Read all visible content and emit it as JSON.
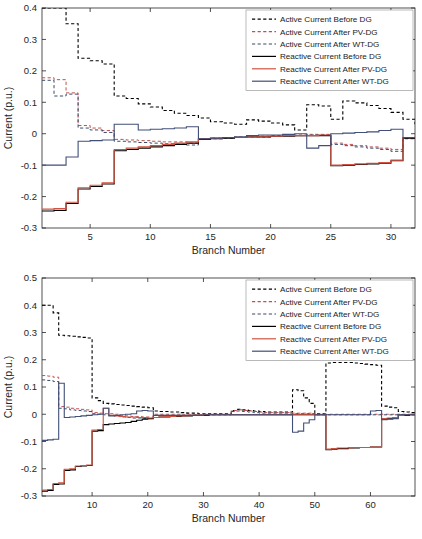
{
  "figure": {
    "title": "",
    "panels": [
      "top",
      "bottom"
    ]
  },
  "legend_entries": [
    {
      "label": "Active Current Before DG",
      "color": "#000000",
      "style": "dashed"
    },
    {
      "label": "Active Current After PV-DG",
      "color": "#c0504d",
      "style": "dashed"
    },
    {
      "label": "Active Current After WT-DG",
      "color": "#3b4a6b",
      "style": "dashed"
    },
    {
      "label": "Reactive Current Before DG",
      "color": "#000000",
      "style": "solid"
    },
    {
      "label": "Reactive Current After PV-DG",
      "color": "#cf5340",
      "style": "solid"
    },
    {
      "label": "Reactive Current After WT-DG",
      "color": "#414f77",
      "style": "solid"
    }
  ],
  "chart_data": [
    {
      "type": "line",
      "panel": "top",
      "title": "",
      "xlabel": "Branch Number",
      "ylabel": "Current (p.u.)",
      "xlim": [
        1,
        32
      ],
      "ylim": [
        -0.3,
        0.4
      ],
      "xticks": [
        5,
        10,
        15,
        20,
        25,
        30
      ],
      "yticks": [
        -0.3,
        -0.2,
        -0.1,
        0,
        0.1,
        0.2,
        0.3,
        0.4
      ],
      "grid": false,
      "legend_position": "top-right",
      "drawstyle": "steps-post",
      "x": [
        1,
        2,
        3,
        4,
        5,
        6,
        7,
        8,
        9,
        10,
        11,
        12,
        13,
        14,
        15,
        16,
        17,
        18,
        19,
        20,
        21,
        22,
        23,
        24,
        25,
        26,
        27,
        28,
        29,
        30,
        31,
        32
      ],
      "series": [
        {
          "name": "Active Current Before DG",
          "color": "#000000",
          "style": "dashed",
          "width": 1.1,
          "values": [
            0.4,
            0.4,
            0.35,
            0.24,
            0.232,
            0.222,
            0.12,
            0.112,
            0.095,
            0.085,
            0.074,
            0.065,
            0.058,
            0.05,
            0.038,
            0.034,
            0.03,
            0.044,
            0.04,
            0.034,
            0.028,
            0.012,
            0.092,
            0.088,
            0.046,
            0.104,
            0.098,
            0.09,
            0.08,
            0.068,
            0.046,
            0.03
          ]
        },
        {
          "name": "Active Current After PV-DG",
          "color": "#c0504d",
          "style": "dashed",
          "width": 1.0,
          "values": [
            0.178,
            0.172,
            0.13,
            0.026,
            0.018,
            0.01,
            -0.018,
            -0.02,
            -0.022,
            -0.024,
            -0.026,
            -0.026,
            -0.03,
            -0.016,
            -0.014,
            -0.012,
            -0.01,
            -0.008,
            -0.008,
            -0.006,
            -0.004,
            -0.004,
            -0.002,
            -0.002,
            -0.03,
            -0.034,
            -0.038,
            -0.042,
            -0.046,
            -0.05,
            -0.014,
            -0.012
          ]
        },
        {
          "name": "Active Current After WT-DG",
          "color": "#3b4a6b",
          "style": "dashed",
          "width": 1.0,
          "values": [
            0.17,
            0.12,
            0.126,
            0.018,
            0.012,
            0.004,
            -0.024,
            -0.026,
            -0.028,
            -0.03,
            -0.032,
            -0.032,
            -0.036,
            -0.018,
            -0.016,
            -0.014,
            -0.012,
            -0.01,
            -0.01,
            -0.008,
            -0.006,
            -0.006,
            -0.004,
            -0.004,
            -0.034,
            -0.038,
            -0.042,
            -0.046,
            -0.05,
            -0.056,
            -0.016,
            -0.014
          ]
        },
        {
          "name": "Reactive Current Before DG",
          "color": "#000000",
          "style": "solid",
          "width": 1.1,
          "values": [
            -0.246,
            -0.244,
            -0.222,
            -0.176,
            -0.168,
            -0.16,
            -0.054,
            -0.05,
            -0.046,
            -0.042,
            -0.038,
            -0.034,
            -0.03,
            -0.018,
            -0.016,
            -0.014,
            -0.012,
            -0.01,
            -0.01,
            -0.008,
            -0.008,
            -0.006,
            -0.006,
            -0.006,
            -0.102,
            -0.1,
            -0.098,
            -0.096,
            -0.094,
            -0.086,
            -0.014,
            -0.012
          ]
        },
        {
          "name": "Reactive Current After PV-DG",
          "color": "#cf5340",
          "style": "solid",
          "width": 1.1,
          "values": [
            -0.24,
            -0.238,
            -0.218,
            -0.172,
            -0.164,
            -0.156,
            -0.05,
            -0.046,
            -0.042,
            -0.038,
            -0.034,
            -0.03,
            -0.026,
            -0.016,
            -0.014,
            -0.012,
            -0.012,
            -0.01,
            -0.008,
            -0.008,
            -0.006,
            -0.006,
            -0.006,
            -0.004,
            -0.1,
            -0.098,
            -0.096,
            -0.094,
            -0.092,
            -0.084,
            -0.012,
            -0.01
          ]
        },
        {
          "name": "Reactive Current After WT-DG",
          "color": "#414f77",
          "style": "solid",
          "width": 1.1,
          "values": [
            -0.1,
            -0.1,
            -0.074,
            -0.024,
            -0.022,
            -0.02,
            0.03,
            0.03,
            0.012,
            0.014,
            0.016,
            0.018,
            0.022,
            -0.016,
            -0.014,
            -0.012,
            -0.01,
            -0.006,
            -0.004,
            -0.004,
            -0.002,
            0.0,
            -0.046,
            -0.038,
            0.0,
            0.002,
            0.004,
            0.006,
            0.01,
            0.014,
            -0.012,
            -0.01
          ]
        }
      ]
    },
    {
      "type": "line",
      "panel": "bottom",
      "title": "",
      "xlabel": "Branch Number",
      "ylabel": "Current (p.u.)",
      "xlim": [
        1,
        68
      ],
      "ylim": [
        -0.3,
        0.5
      ],
      "xticks": [
        10,
        20,
        30,
        40,
        50,
        60
      ],
      "yticks": [
        -0.3,
        -0.2,
        -0.1,
        0,
        0.1,
        0.2,
        0.3,
        0.4,
        0.5
      ],
      "grid": false,
      "legend_position": "top-right",
      "drawstyle": "steps-post",
      "x": [
        1,
        2,
        3,
        4,
        5,
        6,
        7,
        8,
        9,
        10,
        11,
        12,
        13,
        14,
        15,
        16,
        17,
        18,
        19,
        20,
        21,
        22,
        23,
        24,
        25,
        26,
        27,
        28,
        29,
        30,
        31,
        32,
        33,
        34,
        35,
        36,
        37,
        38,
        39,
        40,
        41,
        42,
        43,
        44,
        45,
        46,
        47,
        48,
        49,
        50,
        51,
        52,
        53,
        54,
        55,
        56,
        57,
        58,
        59,
        60,
        61,
        62,
        63,
        64,
        65,
        66,
        67,
        68
      ],
      "series": [
        {
          "name": "Active Current Before DG",
          "color": "#000000",
          "style": "dashed",
          "width": 1.1,
          "values": [
            0.4,
            0.4,
            0.372,
            0.29,
            0.288,
            0.286,
            0.284,
            0.282,
            0.28,
            0.06,
            0.05,
            0.04,
            0.038,
            0.036,
            0.034,
            0.032,
            0.03,
            0.028,
            0.026,
            0.024,
            0.012,
            0.01,
            0.01,
            0.008,
            0.008,
            0.006,
            0.004,
            0.004,
            0.002,
            0.002,
            0.002,
            0.002,
            0.002,
            0.002,
            0.014,
            0.018,
            0.016,
            0.014,
            0.012,
            0.01,
            0.008,
            0.008,
            0.008,
            0.008,
            0.008,
            0.09,
            0.086,
            0.06,
            0.04,
            0.002,
            0.002,
            0.188,
            0.19,
            0.19,
            0.19,
            0.19,
            0.188,
            0.186,
            0.184,
            0.182,
            0.18,
            0.03,
            0.026,
            0.024,
            0.01,
            0.008,
            0.006,
            0.004
          ]
        },
        {
          "name": "Active Current After PV-DG",
          "color": "#c0504d",
          "style": "dashed",
          "width": 1.0,
          "values": [
            0.142,
            0.14,
            0.136,
            0.028,
            0.026,
            0.022,
            0.02,
            0.018,
            0.016,
            0.006,
            0.004,
            0.002,
            0.002,
            0.0,
            -0.004,
            -0.006,
            -0.008,
            -0.008,
            -0.01,
            -0.01,
            0.0,
            0.0,
            0.0,
            0.0,
            0.0,
            -0.002,
            -0.002,
            -0.002,
            -0.002,
            0.0,
            0.0,
            0.0,
            0.0,
            0.0,
            0.014,
            0.016,
            0.014,
            0.012,
            0.01,
            0.008,
            0.006,
            0.006,
            0.006,
            0.006,
            0.006,
            0.004,
            0.004,
            0.004,
            0.004,
            0.0,
            0.0,
            0.0,
            0.0,
            0.0,
            0.0,
            0.0,
            0.0,
            0.0,
            0.0,
            0.0,
            0.0,
            0.0,
            0.0,
            0.0,
            0.0,
            0.0,
            0.0,
            0.0
          ]
        },
        {
          "name": "Active Current After WT-DG",
          "color": "#3b4a6b",
          "style": "dashed",
          "width": 1.0,
          "values": [
            0.126,
            0.124,
            0.12,
            0.022,
            0.02,
            0.016,
            0.014,
            0.012,
            0.01,
            0.002,
            0.0,
            -0.002,
            -0.004,
            -0.006,
            -0.01,
            -0.012,
            -0.014,
            -0.014,
            -0.016,
            -0.016,
            -0.004,
            -0.004,
            -0.004,
            -0.004,
            -0.004,
            -0.004,
            -0.004,
            -0.004,
            -0.004,
            -0.002,
            -0.002,
            -0.002,
            -0.002,
            -0.002,
            0.01,
            0.012,
            0.01,
            0.008,
            0.006,
            0.004,
            0.004,
            0.004,
            0.004,
            0.004,
            0.004,
            0.002,
            0.002,
            0.002,
            0.002,
            -0.002,
            -0.002,
            -0.002,
            -0.002,
            -0.002,
            -0.002,
            -0.002,
            -0.002,
            -0.002,
            -0.002,
            -0.002,
            -0.002,
            -0.002,
            -0.002,
            -0.002,
            -0.002,
            -0.002,
            -0.002,
            -0.002
          ]
        },
        {
          "name": "Reactive Current Before DG",
          "color": "#000000",
          "style": "solid",
          "width": 1.1,
          "values": [
            -0.282,
            -0.28,
            -0.258,
            -0.256,
            -0.206,
            -0.204,
            -0.192,
            -0.19,
            -0.188,
            -0.062,
            -0.06,
            -0.038,
            -0.036,
            -0.034,
            -0.032,
            -0.03,
            -0.026,
            -0.022,
            -0.018,
            -0.016,
            -0.012,
            -0.01,
            -0.01,
            -0.008,
            -0.008,
            -0.006,
            -0.006,
            -0.004,
            -0.004,
            -0.004,
            -0.002,
            -0.002,
            -0.002,
            -0.002,
            -0.002,
            -0.002,
            -0.002,
            -0.002,
            -0.002,
            -0.002,
            -0.002,
            -0.002,
            -0.002,
            -0.002,
            -0.002,
            -0.002,
            -0.002,
            -0.002,
            -0.002,
            -0.002,
            -0.002,
            -0.13,
            -0.128,
            -0.126,
            -0.126,
            -0.124,
            -0.124,
            -0.122,
            -0.122,
            -0.12,
            -0.12,
            -0.018,
            -0.016,
            -0.014,
            -0.004,
            -0.004,
            -0.002,
            -0.002
          ]
        },
        {
          "name": "Reactive Current After PV-DG",
          "color": "#cf5340",
          "style": "solid",
          "width": 1.1,
          "values": [
            -0.278,
            -0.276,
            -0.254,
            -0.252,
            -0.202,
            -0.2,
            -0.19,
            -0.188,
            -0.186,
            -0.058,
            -0.056,
            0.022,
            -0.004,
            -0.006,
            -0.008,
            -0.01,
            -0.01,
            -0.012,
            -0.012,
            -0.014,
            -0.012,
            -0.01,
            -0.008,
            -0.008,
            -0.006,
            -0.006,
            -0.004,
            -0.004,
            -0.004,
            -0.002,
            -0.002,
            -0.002,
            -0.002,
            -0.002,
            -0.002,
            -0.002,
            -0.002,
            -0.002,
            -0.002,
            -0.002,
            -0.002,
            -0.002,
            -0.002,
            -0.002,
            -0.002,
            -0.002,
            -0.002,
            -0.002,
            -0.002,
            -0.002,
            -0.002,
            -0.128,
            -0.126,
            -0.124,
            -0.124,
            -0.124,
            -0.122,
            -0.122,
            -0.122,
            -0.12,
            -0.12,
            -0.016,
            -0.014,
            -0.012,
            -0.004,
            -0.002,
            -0.002,
            -0.002
          ]
        },
        {
          "name": "Reactive Current After WT-DG",
          "color": "#414f77",
          "style": "solid",
          "width": 1.1,
          "values": [
            -0.096,
            -0.094,
            -0.092,
            0.114,
            -0.012,
            -0.01,
            -0.008,
            -0.006,
            -0.004,
            -0.002,
            0.0,
            0.022,
            -0.006,
            -0.004,
            -0.002,
            0.0,
            0.002,
            0.012,
            0.014,
            0.012,
            -0.004,
            -0.004,
            -0.004,
            -0.004,
            -0.004,
            -0.004,
            -0.004,
            -0.004,
            -0.004,
            -0.002,
            -0.002,
            -0.002,
            -0.002,
            -0.002,
            -0.002,
            -0.002,
            -0.002,
            -0.002,
            -0.002,
            -0.002,
            -0.002,
            -0.002,
            -0.002,
            -0.002,
            -0.002,
            -0.066,
            -0.062,
            -0.032,
            -0.02,
            -0.002,
            -0.002,
            -0.002,
            -0.002,
            -0.002,
            -0.002,
            -0.002,
            -0.002,
            -0.002,
            -0.002,
            0.012,
            0.014,
            -0.02,
            -0.018,
            -0.016,
            -0.002,
            -0.002,
            -0.002,
            -0.002
          ]
        }
      ]
    }
  ]
}
